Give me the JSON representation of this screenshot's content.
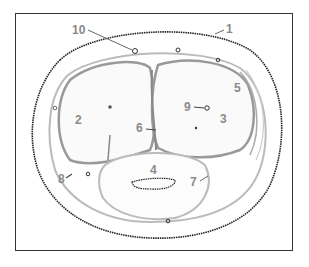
{
  "figure": {
    "labels": [
      {
        "id": "1",
        "text": "1",
        "x": 226,
        "y": 33
      },
      {
        "id": "2",
        "text": "2",
        "x": 75,
        "y": 124
      },
      {
        "id": "3",
        "text": "3",
        "x": 220,
        "y": 123
      },
      {
        "id": "4",
        "text": "4",
        "x": 150,
        "y": 174
      },
      {
        "id": "5",
        "text": "5",
        "x": 234,
        "y": 92
      },
      {
        "id": "6",
        "text": "6",
        "x": 136,
        "y": 132
      },
      {
        "id": "7",
        "text": "7",
        "x": 190,
        "y": 186
      },
      {
        "id": "8",
        "text": "8",
        "x": 58,
        "y": 183
      },
      {
        "id": "9",
        "text": "9",
        "x": 184,
        "y": 111
      },
      {
        "id": "10",
        "text": "10",
        "x": 72,
        "y": 34
      }
    ],
    "colors": {
      "outline": "#222222",
      "muscle": "#9a9a9a",
      "label": "#8a8a8a",
      "frame": "#333333"
    }
  }
}
